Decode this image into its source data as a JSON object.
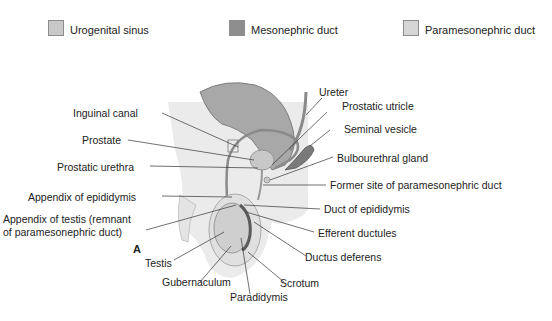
{
  "legend": [
    {
      "label": "Urogenital sinus",
      "color": "#c8c8c8"
    },
    {
      "label": "Mesonephric duct",
      "color": "#8e8e8e"
    },
    {
      "label": "Paramesonephric duct",
      "color": "#d6d6d6"
    }
  ],
  "panel_letter": "A",
  "labels": {
    "ureter": "Ureter",
    "inguinal_canal": "Inguinal canal",
    "prostatic_utricle": "Prostatic utricle",
    "seminal_vesicle": "Seminal vesicle",
    "prostate": "Prostate",
    "prostatic_urethra": "Prostatic urethra",
    "bulbourethral_gland": "Bulbourethral gland",
    "appendix_epididymis": "Appendix of epididymis",
    "former_site": "Former site of paramesonephric duct",
    "appendix_testis_1": "Appendix of testis (remnant",
    "appendix_testis_2": "of paramesonephric duct)",
    "duct_epididymis": "Duct of epididymis",
    "efferent_ductules": "Efferent ductules",
    "ductus_deferens": "Ductus deferens",
    "testis": "Testis",
    "scrotum": "Scrotum",
    "gubernaculum": "Gubernaculum",
    "paradidymis": "Paradidymis"
  },
  "colors": {
    "body_bg": "#ebebeb",
    "bladder": "#a8a8a8",
    "duct": "#8a8a8a",
    "leader": "#333333"
  }
}
